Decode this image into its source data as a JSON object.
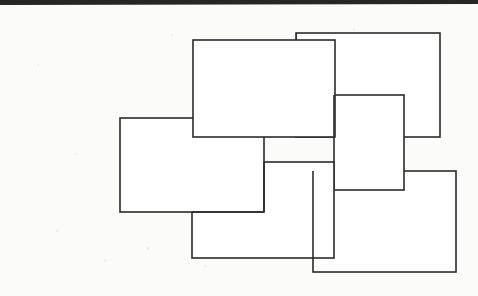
{
  "page": {
    "width": 478,
    "height": 296,
    "background_color": "#fbfbfa",
    "media": "scanned-line-drawing"
  },
  "figure": {
    "name": "interlocking-rectangles",
    "stroke_color": "#2b2b2b",
    "fill_color": "#ffffff",
    "stroke_width": 1.6,
    "shape_count": 6,
    "shapes": [
      {
        "id": "rect-back-top-right",
        "label": "A",
        "x": 296,
        "y": 33,
        "width": 144,
        "height": 104,
        "z": 1
      },
      {
        "id": "rect-top-center",
        "label": "B",
        "x": 193,
        "y": 40,
        "width": 142,
        "height": 97,
        "z": 5
      },
      {
        "id": "rect-middle-right",
        "label": "C",
        "x": 334,
        "y": 95,
        "width": 70,
        "height": 95,
        "z": 3
      },
      {
        "id": "rect-left",
        "label": "D",
        "x": 120,
        "y": 118,
        "width": 144,
        "height": 94,
        "z": 4
      },
      {
        "id": "rect-bottom-center",
        "label": "E",
        "x": 192,
        "y": 162,
        "width": 142,
        "height": 96,
        "z": 3
      },
      {
        "id": "rect-bottom-right",
        "label": "F",
        "x": 313,
        "y": 171,
        "width": 143,
        "height": 101,
        "z": 2
      }
    ]
  },
  "artifacts": {
    "top_edge_band": {
      "name": "scan-edge-band",
      "color": "#262626",
      "description": "Dark slanted page-edge band across the top of the scan",
      "left_y": 4,
      "right_y": 2,
      "thickness_left": 2,
      "thickness_right": 4
    },
    "speckle": {
      "name": "scan-speckle",
      "color": "#969696",
      "description": "Faint gray dust and toner speckles on the paper background"
    }
  }
}
